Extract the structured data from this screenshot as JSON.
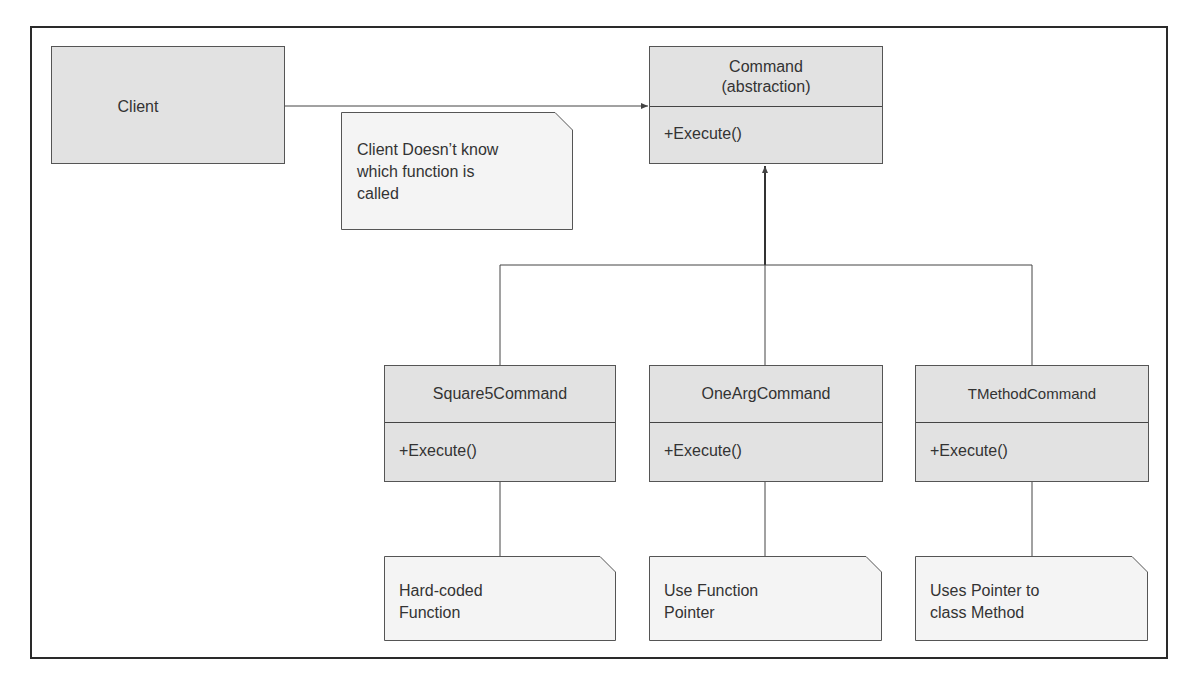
{
  "diagram": {
    "client": {
      "label": "Client"
    },
    "command": {
      "name_line1": "Command",
      "name_line2": "(abstraction)",
      "method": "+Execute()"
    },
    "client_note": {
      "line1": "Client Doesn’t know",
      "line2": "which function is",
      "line3": "called"
    },
    "subclasses": [
      {
        "name": "Square5Command",
        "method": "+Execute()",
        "note_line1": "Hard-coded",
        "note_line2": "Function"
      },
      {
        "name": "OneArgCommand",
        "method": "+Execute()",
        "note_line1": "Use Function",
        "note_line2": "Pointer"
      },
      {
        "name": "TMethodCommand",
        "method": "+Execute()",
        "note_line1": "Uses Pointer to",
        "note_line2": "class Method"
      }
    ],
    "colors": {
      "box_fill": "#e2e2e2",
      "note_fill": "#f4f4f4",
      "line": "#444444",
      "frame": "#2a2a2a"
    }
  }
}
